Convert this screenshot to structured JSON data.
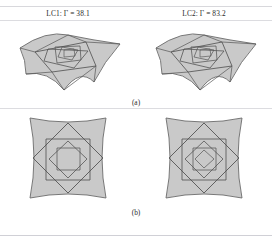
{
  "figure": {
    "panels": [
      {
        "id": "a",
        "caption": "(a)",
        "view": "perspective",
        "items": [
          {
            "key": "lc1",
            "label": "LC1: Γ = 38.1",
            "case": "LC1",
            "symbol": "Γ",
            "value": "38.1",
            "levels": 5
          },
          {
            "key": "lc2",
            "label": "LC2: Γ = 83.2",
            "case": "LC2",
            "symbol": "Γ",
            "value": "83.2",
            "levels": 5
          }
        ]
      },
      {
        "id": "b",
        "caption": "(b)",
        "view": "plan",
        "items": [
          {
            "key": "lc1",
            "label": "LC1: Γ = 38.1",
            "case": "LC1",
            "levels": 4
          },
          {
            "key": "lc2",
            "label": "LC2: Γ = 83.2",
            "case": "LC2",
            "levels": 5
          }
        ]
      }
    ]
  },
  "colors": {
    "surface_fill": "#c9c9c9",
    "surface_fill_light": "#d2d2d2",
    "edge_stroke": "#555555",
    "outline_stroke": "#6a6a6a",
    "rule": "#d8d8dc",
    "text": "#2b2b2b",
    "background": "#ffffff"
  }
}
